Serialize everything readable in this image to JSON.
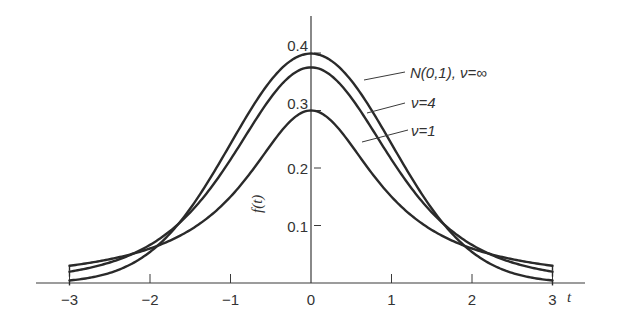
{
  "chart_data": {
    "type": "line",
    "title": "",
    "xlabel": "t",
    "ylabel": "f(t)",
    "xlim": [
      -3,
      3
    ],
    "ylim": [
      0,
      0.42
    ],
    "grid": false,
    "x_ticks": [
      "-3",
      "-2",
      "-1",
      "0",
      "1",
      "2",
      "3"
    ],
    "x_tick_values": [
      -3,
      -2,
      -1,
      0,
      1,
      2,
      3
    ],
    "y_ticks": [
      "0.1",
      "0.2",
      "0.3",
      "0.4"
    ],
    "y_tick_values": [
      0.1,
      0.2,
      0.3,
      0.4
    ],
    "legend_position": "right, leader lines",
    "series": [
      {
        "name": "N(0,1), ν=∞",
        "label": "N(0,1), ν=∞",
        "x": [
          -3,
          -2.5,
          -2,
          -1.5,
          -1,
          -0.5,
          0,
          0.5,
          1,
          1.5,
          2,
          2.5,
          3
        ],
        "values": [
          0.004,
          0.018,
          0.054,
          0.13,
          0.242,
          0.352,
          0.399,
          0.352,
          0.242,
          0.13,
          0.054,
          0.018,
          0.004
        ]
      },
      {
        "name": "ν=4",
        "label": "ν=4",
        "x": [
          -3,
          -2.5,
          -2,
          -1.5,
          -1,
          -0.5,
          0,
          0.5,
          1,
          1.5,
          2,
          2.5,
          3
        ],
        "values": [
          0.02,
          0.04,
          0.066,
          0.124,
          0.215,
          0.322,
          0.375,
          0.322,
          0.215,
          0.124,
          0.066,
          0.04,
          0.02
        ]
      },
      {
        "name": "ν=1",
        "label": "ν=1",
        "x": [
          -3,
          -2.5,
          -2,
          -1.5,
          -1,
          -0.5,
          0,
          0.5,
          1,
          1.5,
          2,
          2.5,
          3
        ],
        "values": [
          0.039,
          0.054,
          0.075,
          0.113,
          0.165,
          0.248,
          0.3,
          0.248,
          0.165,
          0.113,
          0.075,
          0.054,
          0.039
        ]
      }
    ]
  },
  "axes": {
    "x_label": "t",
    "y_label": "f(t)"
  }
}
